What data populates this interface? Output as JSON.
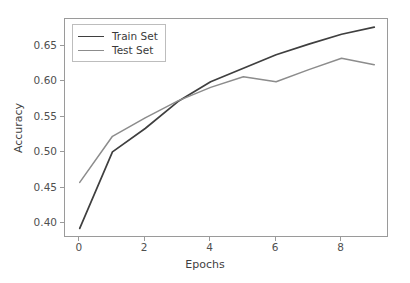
{
  "chart_data": {
    "type": "line",
    "title": "",
    "xlabel": "Epochs",
    "ylabel": "Accuracy",
    "x": [
      0,
      1,
      2,
      3,
      4,
      5,
      6,
      7,
      8,
      9
    ],
    "xlim": [
      -0.45,
      9.45
    ],
    "ylim": [
      0.3795,
      0.6885
    ],
    "xticks": [
      "0",
      "2",
      "4",
      "6",
      "8"
    ],
    "xtick_values": [
      0,
      2,
      4,
      6,
      8
    ],
    "yticks": [
      "0.40",
      "0.45",
      "0.50",
      "0.55",
      "0.60",
      "0.65"
    ],
    "ytick_values": [
      0.4,
      0.45,
      0.5,
      0.55,
      0.6,
      0.65
    ],
    "grid": false,
    "legend_position": "upper left",
    "series": [
      {
        "name": "Train Set",
        "color": "#3f3f3f",
        "values": [
          0.393,
          0.501,
          0.534,
          0.572,
          0.6,
          0.619,
          0.638,
          0.653,
          0.667,
          0.677
        ]
      },
      {
        "name": "Test Set",
        "color": "#8c8c8c",
        "values": [
          0.458,
          0.523,
          0.549,
          0.573,
          0.592,
          0.607,
          0.6,
          0.617,
          0.633,
          0.624
        ]
      }
    ]
  },
  "legend": {
    "items": [
      {
        "label": "Train Set"
      },
      {
        "label": "Test Set"
      }
    ]
  },
  "colors": {
    "train": "#3f3f3f",
    "test": "#8c8c8c",
    "axis": "#9a9a9a",
    "tick_text": "#4f4f4f",
    "background": "#ffffff"
  }
}
